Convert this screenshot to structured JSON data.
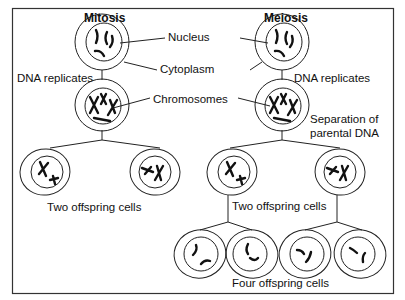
{
  "titles": {
    "mitosis": "Mitosis",
    "meiosis": "Meiosis"
  },
  "labels": {
    "nucleus": "Nucleus",
    "cytoplasm": "Cytoplasm",
    "chromosomes": "Chromosomes",
    "dna_replicates_left": "DNA replicates",
    "dna_replicates_right": "DNA replicates",
    "separation_line1": "Separation of",
    "separation_line2": "parental DNA",
    "mitosis_offspring": "Two offspring cells",
    "meiosis_two_offspring": "Two offspring cells",
    "meiosis_four_offspring": "Four offspring cells"
  },
  "colors": {
    "line": "#222222",
    "background": "#ffffff",
    "frame": "#333333"
  }
}
